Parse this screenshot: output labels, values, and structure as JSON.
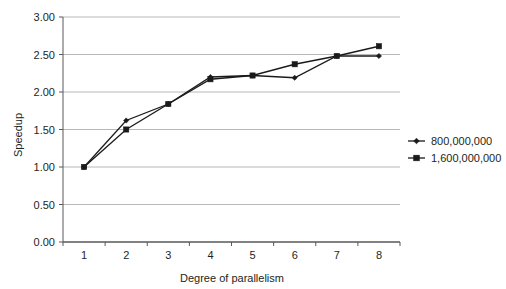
{
  "chart_data": {
    "type": "line",
    "title": "",
    "xlabel": "Degree of parallelism",
    "ylabel": "Speedup",
    "categories": [
      1,
      2,
      3,
      4,
      5,
      6,
      7,
      8
    ],
    "xtick_labels": [
      "1",
      "2",
      "3",
      "4",
      "5",
      "6",
      "7",
      "8"
    ],
    "ytick_labels": [
      "0.00",
      "0.50",
      "1.00",
      "1.50",
      "2.00",
      "2.50",
      "3.00"
    ],
    "ytick_values": [
      0.0,
      0.5,
      1.0,
      1.5,
      2.0,
      2.5,
      3.0
    ],
    "ylim": [
      0.0,
      3.0
    ],
    "grid": "horizontal",
    "legend_position": "right",
    "series": [
      {
        "name": "800,000,000",
        "marker": "diamond",
        "color": "#1a1a1a",
        "values": [
          1.0,
          1.62,
          1.84,
          2.2,
          2.22,
          2.19,
          2.48,
          2.48
        ]
      },
      {
        "name": "1,600,000,000",
        "marker": "square",
        "color": "#1a1a1a",
        "values": [
          1.0,
          1.5,
          1.84,
          2.17,
          2.22,
          2.37,
          2.48,
          2.61
        ]
      }
    ]
  },
  "axes": {
    "y_title": "Speedup",
    "x_title": "Degree of parallelism"
  },
  "legend": {
    "entries": [
      {
        "label": "800,000,000",
        "marker": "diamond-marker-icon"
      },
      {
        "label": "1,600,000,000",
        "marker": "square-marker-icon"
      }
    ]
  }
}
